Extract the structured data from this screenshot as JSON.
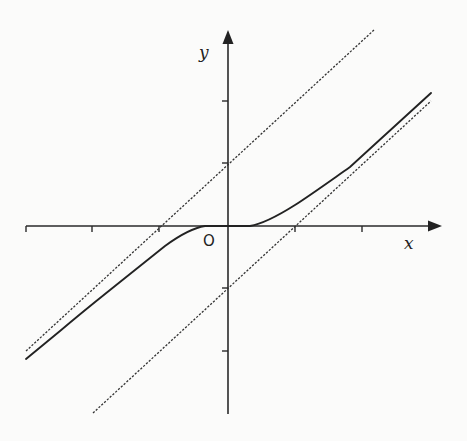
{
  "figure": {
    "type": "function graph with asymptotes",
    "labels": {
      "x_axis": "x",
      "y_axis": "y",
      "origin": "O"
    },
    "colors": {
      "background": "#fbfbfa",
      "ink": "#222222"
    },
    "axes": {
      "x_ticks_units": [
        -3,
        -2,
        -1,
        1,
        2
      ],
      "y_ticks_units": [
        -2,
        -1,
        1,
        2
      ],
      "arrow_x": true,
      "arrow_y": true
    },
    "asymptotes": [
      {
        "equation": "y = x + 1",
        "style": "dashed",
        "y_intercept": 1,
        "x_intercept": -1
      },
      {
        "equation": "y = x - 1",
        "style": "dashed",
        "y_intercept": -1,
        "x_intercept": 1
      }
    ],
    "curve": {
      "style": "solid",
      "description": "Curve tangent to the x-axis at the origin; approaches y = x + 1 as x → −∞ and y = x − 1 as x → +∞"
    }
  }
}
